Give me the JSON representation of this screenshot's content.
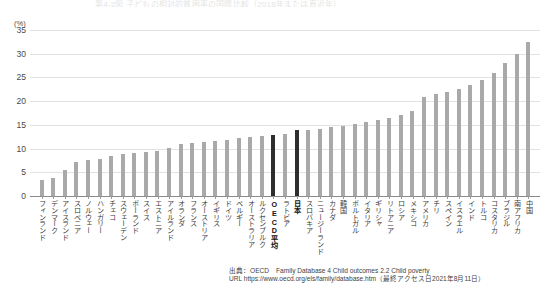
{
  "title_strip": "第4-2図 子どもの相対的貧困率の国際比較（2018年または直近年）",
  "axis": {
    "y_unit": "(%)",
    "y_ticks": [
      0,
      5,
      10,
      15,
      20,
      25,
      30,
      35
    ],
    "y_min": 0,
    "y_max": 35
  },
  "source": {
    "line1": "出典：OECD　Family Database 4 Child outcomes 2.2 Child poverty",
    "line2": "URL https://www.oecd.org/els/family/database.htm（最終アクセス日2021年8月11日）"
  },
  "colors": {
    "bar": "#a9a9a9",
    "bar_highlight": "#2e2e2e",
    "grid": "#e2e2e2",
    "axis": "#8a8a8a",
    "text": "#3a3a3a"
  },
  "chart_data": {
    "type": "bar",
    "title": "第4-2図 子どもの相対的貧困率の国際比較（2018年または直近年）",
    "xlabel": "",
    "ylabel": "(%)",
    "ylim": [
      0,
      35
    ],
    "grid": true,
    "legend": "none",
    "highlight_categories": [
      "OECD平均",
      "日本"
    ],
    "categories": [
      "フィンランド",
      "デンマーク",
      "アイスランド",
      "スロベニア",
      "ノルウェー",
      "ハンガリー",
      "チェコ",
      "スウェーデン",
      "ポーランド",
      "スイス",
      "エストニア",
      "アイルランド",
      "オランダ",
      "フランス",
      "オーストリア",
      "イギリス",
      "ドイツ",
      "ベルギー",
      "オーストラリア",
      "ルクセンブルク",
      "OECD平均",
      "ラトビア",
      "日本",
      "スロバキア",
      "ニュージーランド",
      "カナダ",
      "韓国",
      "ポルトガル",
      "イタリア",
      "ギリシャ",
      "リトアニア",
      "ロシア",
      "メキシコ",
      "アメリカ",
      "チリ",
      "スペイン",
      "イスラエル",
      "インド",
      "トルコ",
      "コスタリカ",
      "ブラジル",
      "南アフリカ",
      "中国"
    ],
    "values": [
      3.3,
      3.7,
      5.5,
      7.1,
      7.5,
      7.7,
      8.5,
      8.8,
      9.0,
      9.2,
      9.4,
      10.1,
      10.9,
      11.1,
      11.4,
      11.6,
      11.9,
      12.2,
      12.5,
      12.6,
      12.8,
      13.0,
      13.9,
      14.0,
      14.2,
      14.6,
      14.8,
      15.1,
      15.6,
      16.0,
      16.5,
      17.0,
      18.0,
      20.9,
      21.5,
      22.0,
      22.5,
      23.5,
      24.5,
      26.0,
      28.0,
      30.0,
      32.5
    ]
  }
}
